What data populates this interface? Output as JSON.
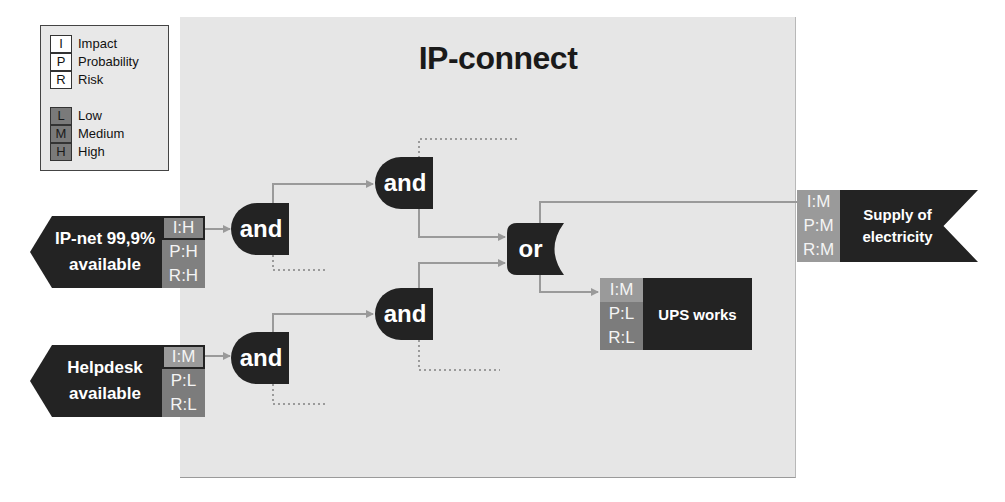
{
  "title": "IP-connect",
  "legend": {
    "metrics": [
      {
        "key": "I",
        "label": "Impact"
      },
      {
        "key": "P",
        "label": "Probability"
      },
      {
        "key": "R",
        "label": "Risk"
      }
    ],
    "levels": [
      {
        "key": "L",
        "label": "Low"
      },
      {
        "key": "M",
        "label": "Medium"
      },
      {
        "key": "H",
        "label": "High"
      }
    ]
  },
  "inputs": [
    {
      "id": "ip-net",
      "line1": "IP-net 99,9%",
      "line2": "available",
      "impact": "I:H",
      "probability": "P:H",
      "risk": "R:H"
    },
    {
      "id": "helpdesk",
      "line1": "Helpdesk",
      "line2": "available",
      "impact": "I:M",
      "probability": "P:L",
      "risk": "R:L"
    }
  ],
  "gates": [
    {
      "id": "and-1",
      "type": "and",
      "label": "and"
    },
    {
      "id": "and-2",
      "type": "and",
      "label": "and"
    },
    {
      "id": "and-3",
      "type": "and",
      "label": "and"
    },
    {
      "id": "and-4",
      "type": "and",
      "label": "and"
    },
    {
      "id": "or-1",
      "type": "or",
      "label": "or"
    }
  ],
  "outputs": [
    {
      "id": "ups",
      "label": "UPS works",
      "impact": "I:M",
      "probability": "P:L",
      "risk": "R:L"
    },
    {
      "id": "supply",
      "line1": "Supply of",
      "line2": "electricity",
      "impact": "I:M",
      "probability": "P:M",
      "risk": "R:M"
    }
  ],
  "colors": {
    "node": "#232323",
    "panel": "#e6e6e6",
    "wire": "#9a9a9a",
    "level_gray": "#808080"
  }
}
